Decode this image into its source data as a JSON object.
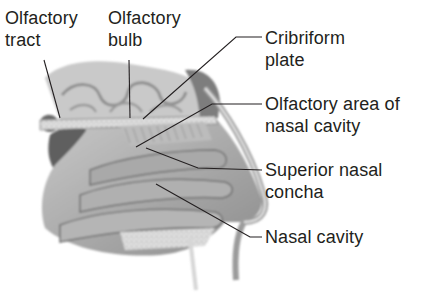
{
  "diagram": {
    "type": "anatomical-illustration",
    "colors": {
      "label_text": "#231f20",
      "leader_line": "#231f20",
      "background": "#ffffff",
      "illustration_tone": "grayscale"
    },
    "labels": [
      {
        "id": "olfactory-tract",
        "lines": [
          "Olfactory",
          "tract"
        ]
      },
      {
        "id": "olfactory-bulb",
        "lines": [
          "Olfactory",
          "bulb"
        ]
      },
      {
        "id": "cribriform-plate",
        "lines": [
          "Cribriform",
          "plate"
        ]
      },
      {
        "id": "olfactory-area",
        "lines": [
          "Olfactory area of",
          "nasal cavity"
        ]
      },
      {
        "id": "superior-nasal-concha",
        "lines": [
          "Superior nasal",
          "concha"
        ]
      },
      {
        "id": "nasal-cavity",
        "lines": [
          "Nasal cavity"
        ]
      }
    ]
  }
}
